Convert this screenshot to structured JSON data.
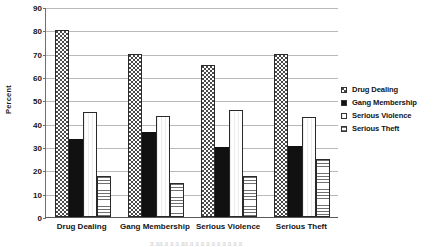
{
  "chart_data": {
    "type": "bar",
    "title": "",
    "xlabel": "",
    "ylabel": "Percent",
    "ylim": [
      0,
      90
    ],
    "ytick_step": 10,
    "yticks": [
      0,
      10,
      20,
      30,
      40,
      50,
      60,
      70,
      80,
      90
    ],
    "grid": true,
    "legend_position": "right",
    "categories": [
      "Drug Dealing",
      "Gang Membership",
      "Serious Violence",
      "Serious Theft"
    ],
    "series": [
      {
        "name": "Drug Dealing",
        "pattern": "dotted",
        "values": [
          80,
          70,
          65,
          70
        ]
      },
      {
        "name": "Gang Membership",
        "pattern": "solid",
        "values": [
          33.5,
          36.5,
          30,
          30.5
        ]
      },
      {
        "name": "Serious Violence",
        "pattern": "vertical",
        "values": [
          45,
          43.5,
          46,
          43
        ]
      },
      {
        "name": "Serious Theft",
        "pattern": "horizontal",
        "values": [
          17.5,
          14.5,
          17.5,
          25
        ]
      }
    ]
  },
  "axis": {
    "y_title": "Percent",
    "y_tick_labels": [
      "0",
      "10",
      "20",
      "30",
      "40",
      "50",
      "60",
      "70",
      "80",
      "90"
    ],
    "x_tick_labels": [
      "Drug Dealing",
      "Gang Membership",
      "Serious Violence",
      "Serious Theft"
    ]
  },
  "legend": {
    "items": [
      {
        "label": "Drug Dealing",
        "pattern": "dotted"
      },
      {
        "label": "Gang Membership",
        "pattern": "solid"
      },
      {
        "label": "Serious Violence",
        "pattern": "vertical"
      },
      {
        "label": "Serious Theft",
        "pattern": "horizontal"
      }
    ]
  },
  "page_bleed_text": "a aa a a a aa a a a  a a a a a a a"
}
